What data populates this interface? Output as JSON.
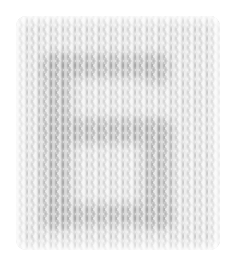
{
  "image": {
    "subject": "knitted swatch with intarsia letter",
    "description": "Light gray stockinette knit swatch with a darker gray letter-like motif (top band, left bar, middle band, lower right bar, bottom band)",
    "colors": {
      "background": "#ffffff",
      "yarn_light": "#ececec",
      "yarn_dark": "#bdbdbd"
    }
  }
}
